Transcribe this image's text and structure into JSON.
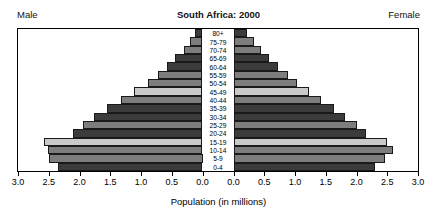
{
  "header": {
    "left_label": "Male",
    "right_label": "Female",
    "title": "South Africa: 2000"
  },
  "axis": {
    "title": "Population (in millions)",
    "tick_labels_left": [
      "3.0",
      "2.5",
      "2.0",
      "1.5",
      "1.0",
      "0.5",
      "0.0"
    ],
    "tick_labels_right": [
      "0.0",
      "0.5",
      "1.0",
      "1.5",
      "2.0",
      "2.5",
      "3.0"
    ],
    "max": 3.0,
    "step": 0.5,
    "units": "millions"
  },
  "colors": {
    "dark": "#3b3b3b",
    "medium": "#7d7d7d",
    "light": "#c9c9c9",
    "outline": "#1a1a1a",
    "frame": "#000000",
    "background": "#ffffff"
  },
  "chart_data": {
    "type": "bar",
    "subtype": "population-pyramid",
    "title": "South Africa: 2000",
    "xlabel": "Population (in millions)",
    "ylabel": "",
    "xlim": [
      0,
      3.0
    ],
    "grid": false,
    "legend": "none",
    "orientation": "horizontal",
    "categories": [
      "80+",
      "75-79",
      "70-74",
      "65-69",
      "60-64",
      "55-59",
      "50-54",
      "45-49",
      "40-44",
      "35-39",
      "30-34",
      "25-29",
      "20-24",
      "15-19",
      "10-14",
      "5-9",
      "0-4"
    ],
    "band_shades": [
      "dark",
      "medium",
      "medium",
      "dark",
      "dark",
      "medium",
      "medium",
      "light",
      "medium",
      "dark",
      "dark",
      "medium",
      "dark",
      "light",
      "medium",
      "medium",
      "dark"
    ],
    "series": [
      {
        "name": "Male",
        "side": "left",
        "values": [
          0.12,
          0.2,
          0.3,
          0.44,
          0.58,
          0.72,
          0.88,
          1.12,
          1.33,
          1.56,
          1.77,
          1.95,
          2.1,
          2.58,
          2.52,
          2.5,
          2.35
        ]
      },
      {
        "name": "Female",
        "side": "right",
        "values": [
          0.22,
          0.33,
          0.44,
          0.58,
          0.73,
          0.88,
          1.04,
          1.23,
          1.42,
          1.63,
          1.82,
          2.0,
          2.16,
          2.5,
          2.6,
          2.46,
          2.3
        ]
      }
    ]
  }
}
